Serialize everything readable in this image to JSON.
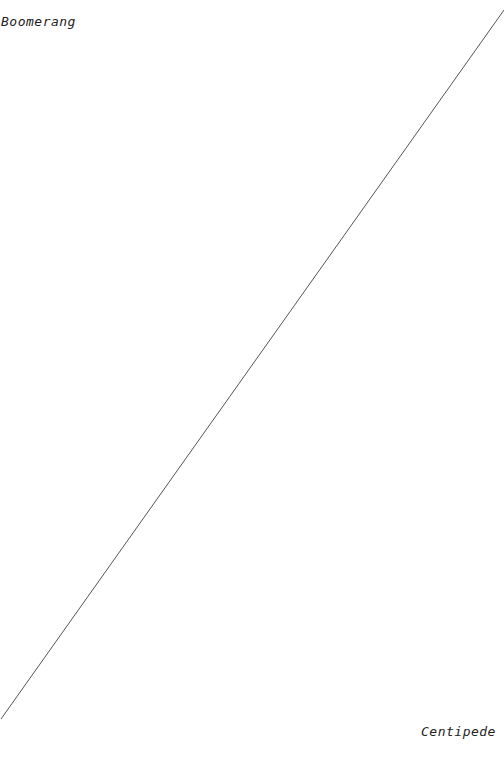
{
  "labels": {
    "top_left": "Boomerang",
    "bottom_right": "Centipede"
  },
  "line": {
    "x1": 1,
    "y1": 719,
    "x2": 504,
    "y2": 10,
    "color": "#555555"
  }
}
